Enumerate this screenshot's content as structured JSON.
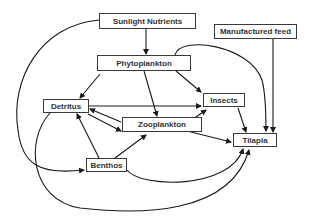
{
  "diagram": {
    "type": "food-web",
    "nodes": [
      {
        "id": "sunlight",
        "label": "Sunlight Nutrients"
      },
      {
        "id": "phyto",
        "label": "Phytoplankton"
      },
      {
        "id": "feed",
        "label": "Manufactured feed"
      },
      {
        "id": "detritus",
        "label": "Detritus"
      },
      {
        "id": "zoo",
        "label": "Zooplankton"
      },
      {
        "id": "insects",
        "label": "Insects"
      },
      {
        "id": "tilapia",
        "label": "Tilapia"
      },
      {
        "id": "benthos",
        "label": "Benthos"
      }
    ],
    "edges": [
      {
        "from": "sunlight",
        "to": "phyto"
      },
      {
        "from": "sunlight",
        "to": "benthos"
      },
      {
        "from": "phyto",
        "to": "detritus"
      },
      {
        "from": "phyto",
        "to": "zoo"
      },
      {
        "from": "phyto",
        "to": "insects"
      },
      {
        "from": "phyto",
        "to": "tilapia"
      },
      {
        "from": "detritus",
        "to": "insects"
      },
      {
        "from": "detritus",
        "to": "zoo"
      },
      {
        "from": "zoo",
        "to": "detritus"
      },
      {
        "from": "detritus",
        "to": "tilapia"
      },
      {
        "from": "zoo",
        "to": "insects"
      },
      {
        "from": "zoo",
        "to": "tilapia"
      },
      {
        "from": "benthos",
        "to": "detritus"
      },
      {
        "from": "benthos",
        "to": "zoo"
      },
      {
        "from": "benthos",
        "to": "tilapia"
      },
      {
        "from": "insects",
        "to": "tilapia"
      },
      {
        "from": "feed",
        "to": "tilapia"
      }
    ],
    "colors": {
      "line": "#1a1a1a",
      "border": "#3a3a3a",
      "text": "#333333",
      "background": "#ffffff"
    }
  }
}
